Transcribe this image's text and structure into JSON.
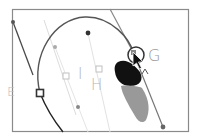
{
  "canvas": {
    "width": 202,
    "height": 140,
    "background": "#ffffff"
  },
  "frame": {
    "x": 12,
    "y": 9,
    "width": 177,
    "height": 123,
    "stroke": "#8a8a8a"
  },
  "labels": {
    "g": {
      "text": "G",
      "x": 148,
      "y": 48,
      "color": "#9a9a9a"
    },
    "h": {
      "text": "H",
      "x": 92,
      "y": 78,
      "color": "#b8b8b8"
    },
    "i": {
      "text": "I",
      "x": 78,
      "y": 68,
      "color": "#b8b8b8"
    },
    "e": {
      "text": "E",
      "x": 8,
      "y": 85,
      "color": "#b8b8b8"
    }
  },
  "colors": {
    "path_dark": "#3a3a3a",
    "handle_gray": "#8c8c8c",
    "handle_light": "#cfcfcf",
    "shape_black": "#111111",
    "shape_gray": "#9a9a9a"
  },
  "icons": {
    "cursor": "pen-tool-arrow-cursor",
    "anchor_selected": "hollow-square-anchor",
    "anchor_unselected": "light-square-anchor",
    "handle_point": "round-handle-dot",
    "target_ring": "circle-anchor-highlight"
  }
}
